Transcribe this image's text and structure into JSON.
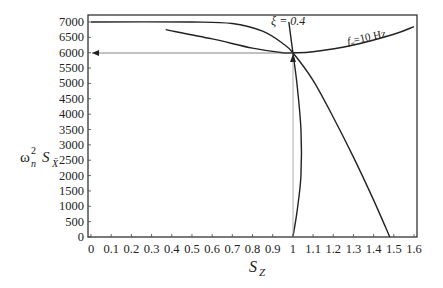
{
  "chart_data": {
    "type": "line",
    "title": "",
    "xlabel": "S_Z",
    "ylabel": "ω_n² S_Ẍ",
    "xlim": [
      0,
      1.6
    ],
    "ylim": [
      0,
      7000
    ],
    "grid": false,
    "xticks": [
      "0",
      "0.1",
      "0.2",
      "0.3",
      "0.4",
      "0.5",
      "0.6",
      "0.7",
      "0.8",
      "0.9",
      "1",
      "1.1",
      "1.2",
      "1.3",
      "1.4",
      "1.5",
      "1.6"
    ],
    "yticks": [
      "0",
      "500",
      "1000",
      "1500",
      "2000",
      "2500",
      "3000",
      "3500",
      "4000",
      "4500",
      "5000",
      "5500",
      "6000",
      "6500",
      "7000"
    ],
    "annotations": [
      {
        "text": "ξ = 0.4",
        "x": 0.99,
        "y": 7050
      },
      {
        "text": "f_n=10 Hz",
        "x": 1.3,
        "y": 6350
      }
    ],
    "series": [
      {
        "name": "upper curve (from 7000 plateau)",
        "x": [
          0,
          0.5,
          0.7,
          0.85,
          0.95,
          1.0,
          1.1,
          1.2,
          1.3,
          1.4,
          1.48
        ],
        "y": [
          7000,
          7000,
          6950,
          6700,
          6300,
          6000,
          5100,
          3900,
          2600,
          1200,
          0
        ]
      },
      {
        "name": "f_n = 10 Hz",
        "x": [
          0.37,
          0.6,
          0.8,
          0.95,
          1.0,
          1.1,
          1.3,
          1.5,
          1.6
        ],
        "y": [
          6750,
          6450,
          6150,
          6000,
          6000,
          6030,
          6250,
          6600,
          6850
        ]
      },
      {
        "name": "ξ = 0.4",
        "x": [
          0.98,
          1.0,
          1.02,
          1.04,
          1.04,
          1.02,
          1.0
        ],
        "y": [
          7000,
          6000,
          5000,
          3500,
          2000,
          800,
          0
        ]
      },
      {
        "name": "reference S_Z=1 / 6000",
        "x": [
          0,
          1,
          1
        ],
        "y": [
          6000,
          6000,
          0
        ]
      }
    ]
  },
  "axis": {
    "x_label_main": "S",
    "x_label_sub": "Z",
    "y_label_omega": "ω",
    "y_label_sup": "2",
    "y_label_n": "n",
    "y_label_S": "S",
    "y_label_sub": "Ẍ"
  },
  "labels": {
    "xi": "ξ = 0.4",
    "fn_f": "f",
    "fn_sub": "n",
    "fn_rest": "=10 Hz"
  }
}
